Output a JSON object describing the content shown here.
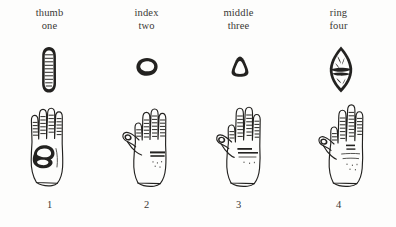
{
  "plate": {
    "background_color": "#fdfdfc",
    "ink_color": "#232220",
    "text_color": "#3a3835",
    "columns": [
      {
        "finger_label": "thumb",
        "number_word": "one",
        "numeral": "1",
        "specimen_icon": "elongated-ridged-oval-print",
        "hand_icon": "palm-with-folded-thumb-hand"
      },
      {
        "finger_label": "index",
        "number_word": "two",
        "numeral": "2",
        "specimen_icon": "small-horizontal-oval-print",
        "hand_icon": "palm-with-extended-thumb-hand"
      },
      {
        "finger_label": "middle",
        "number_word": "three",
        "numeral": "3",
        "specimen_icon": "rounded-triangle-print",
        "hand_icon": "palm-with-spread-fingers-hand"
      },
      {
        "finger_label": "ring",
        "number_word": "four",
        "numeral": "4",
        "specimen_icon": "pointed-lens-banded-print",
        "hand_icon": "palm-with-raised-fingers-hand"
      }
    ]
  }
}
